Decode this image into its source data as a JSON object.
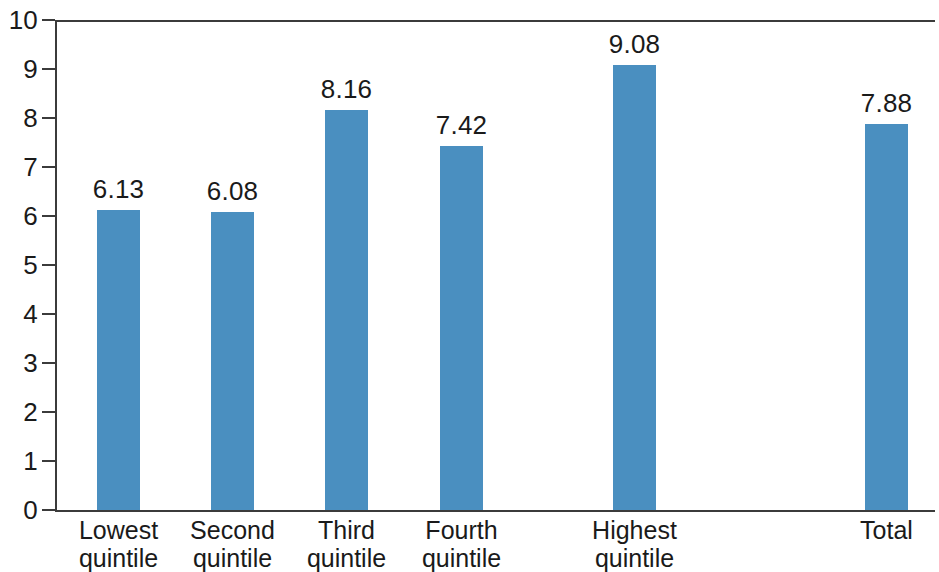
{
  "chart_data": {
    "type": "bar",
    "title": "",
    "subtitle": "",
    "xlabel": "",
    "ylabel": "",
    "ylim": [
      0,
      10
    ],
    "ytick_labels": [
      "10",
      "9",
      "8",
      "7",
      "6",
      "5",
      "4",
      "3",
      "2",
      "1",
      "0"
    ],
    "ytick_values": [
      10,
      9,
      8,
      7,
      6,
      5,
      4,
      3,
      2,
      1,
      0
    ],
    "grid": false,
    "legend": false,
    "legend_position": "none",
    "bar_color": "#4a8fc0",
    "axis_color": "#3b3b3b",
    "background_color": "#ffffff",
    "categories": [
      "Lowest quintile",
      "Second quintile",
      "Third quintile",
      "Fourth quintile",
      "Highest quintile",
      "Total"
    ],
    "category_lines": [
      [
        "Lowest",
        "quintile"
      ],
      [
        "Second",
        "quintile"
      ],
      [
        "Third",
        "quintile"
      ],
      [
        "Fourth",
        "quintile"
      ],
      [
        "Highest",
        "quintile"
      ],
      [
        "Total",
        ""
      ]
    ],
    "values": [
      6.13,
      6.08,
      8.16,
      7.42,
      9.08,
      7.88
    ],
    "value_labels": [
      "6.13",
      "6.08",
      "8.16",
      "7.42",
      "9.08",
      "7.88"
    ]
  },
  "axis": {
    "y": {
      "t10": "10",
      "t9": "9",
      "t8": "8",
      "t7": "7",
      "t6": "6",
      "t5": "5",
      "t4": "4",
      "t3": "3",
      "t2": "2",
      "t1": "1",
      "t0": "0"
    }
  },
  "bars": [
    {
      "value_label": "6.13",
      "line1": "Lowest",
      "line2": "quintile"
    },
    {
      "value_label": "6.08",
      "line1": "Second",
      "line2": "quintile"
    },
    {
      "value_label": "8.16",
      "line1": "Third",
      "line2": "quintile"
    },
    {
      "value_label": "7.42",
      "line1": "Fourth",
      "line2": "quintile"
    },
    {
      "value_label": "9.08",
      "line1": "Highest",
      "line2": "quintile"
    },
    {
      "value_label": "7.88",
      "line1": "Total",
      "line2": ""
    }
  ]
}
